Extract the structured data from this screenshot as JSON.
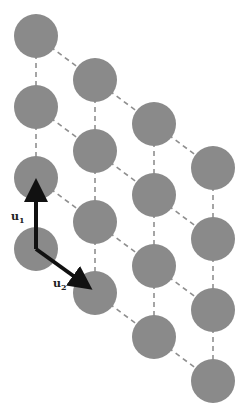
{
  "diagram": {
    "type": "lattice",
    "colors": {
      "atom": "#8a8a8a",
      "bond": "#8f8f8f",
      "vector": "#111111"
    },
    "lattice": {
      "columns": 4,
      "rows_per_column": 4
    },
    "vectors": [
      {
        "name": "u1",
        "label": "u",
        "subscript": "1",
        "direction": "up"
      },
      {
        "name": "u2",
        "label": "u",
        "subscript": "2",
        "direction": "down-right"
      }
    ]
  }
}
